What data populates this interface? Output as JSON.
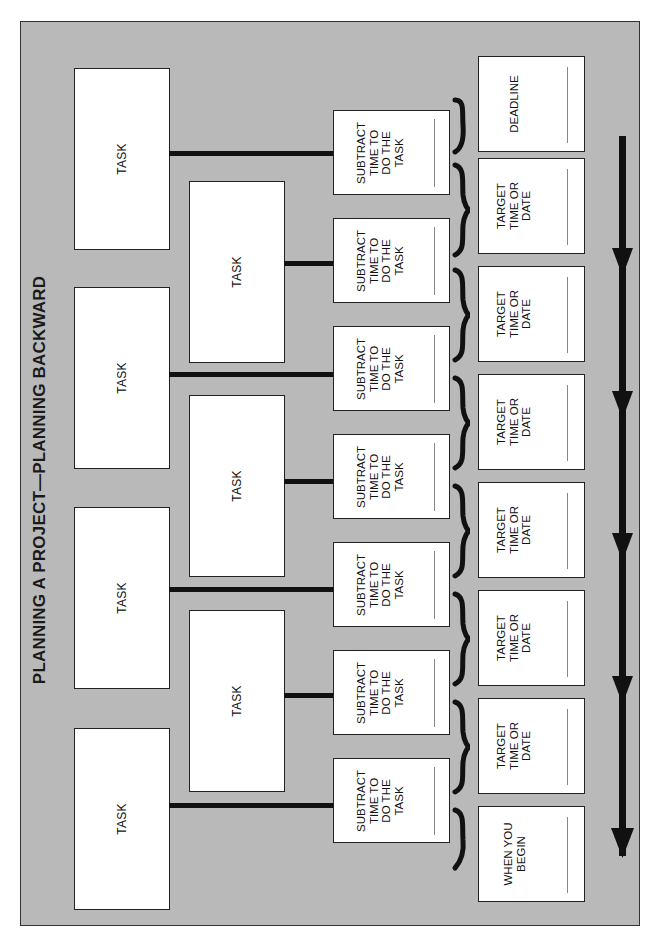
{
  "header": {
    "left_text": "",
    "right_text": ""
  },
  "diagram": {
    "title": "PLANNING A PROJECT—PLANNING BACKWARD",
    "task_label": "TASK",
    "tasks": [
      {
        "label": "TASK",
        "column": "outer"
      },
      {
        "label": "TASK",
        "column": "inner"
      },
      {
        "label": "TASK",
        "column": "outer"
      },
      {
        "label": "TASK",
        "column": "inner"
      },
      {
        "label": "TASK",
        "column": "outer"
      },
      {
        "label": "TASK",
        "column": "inner"
      },
      {
        "label": "TASK",
        "column": "outer"
      }
    ],
    "subtract_steps": [
      {
        "label": "SUBTRACT\nTIME TO\nDO THE\nTASK"
      },
      {
        "label": "SUBTRACT\nTIME TO\nDO THE\nTASK"
      },
      {
        "label": "SUBTRACT\nTIME TO\nDO THE\nTASK"
      },
      {
        "label": "SUBTRACT\nTIME TO\nDO THE\nTASK"
      },
      {
        "label": "SUBTRACT\nTIME TO\nDO THE\nTASK"
      },
      {
        "label": "SUBTRACT\nTIME TO\nDO THE\nTASK"
      },
      {
        "label": "SUBTRACT\nTIME TO\nDO THE\nTASK"
      }
    ],
    "milestones": [
      {
        "label": "DEADLINE"
      },
      {
        "label": "TARGET\nTIME OR\nDATE"
      },
      {
        "label": "TARGET\nTIME OR\nDATE"
      },
      {
        "label": "TARGET\nTIME OR\nDATE"
      },
      {
        "label": "TARGET\nTIME OR\nDATE"
      },
      {
        "label": "TARGET\nTIME OR\nDATE"
      },
      {
        "label": "TARGET\nTIME OR\nDATE"
      },
      {
        "label": "WHEN YOU\nBEGIN"
      }
    ],
    "timeline_arrow": {
      "direction": "down",
      "arrowheads": 5
    },
    "colors": {
      "panel": "#b9b9b9",
      "box": "#ffffff",
      "stroke": "#111111"
    }
  }
}
